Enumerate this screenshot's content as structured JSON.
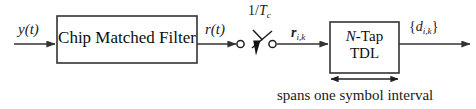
{
  "diagram": {
    "background_color": "#ffffff",
    "line_color": "#333333",
    "text_color": "#111111",
    "blocks": [
      {
        "id": "chip-matched-filter",
        "label": "Chip Matched Filter",
        "x": 57,
        "y": 16,
        "width": 140,
        "height": 47
      },
      {
        "id": "n-tap-tdl",
        "label_line1_italic": "N",
        "label_line1_rest": "-Tap",
        "label_line2": "TDL",
        "x": 330,
        "y": 22,
        "width": 69,
        "height": 51
      }
    ],
    "signals": {
      "input": {
        "base": "y",
        "arg": "(t)",
        "text": "y(t)"
      },
      "filter_output": {
        "base": "r",
        "arg": "(t)",
        "text": "r(t)"
      },
      "sampled": {
        "base": "r",
        "subscript": "i,k",
        "text": "r_i,k",
        "bold": true
      },
      "output": {
        "open": "{",
        "base": "d",
        "subscript": "i,k",
        "close": "}",
        "text": "{d_i,k}"
      }
    },
    "switch": {
      "rate_label_numerator": "1/",
      "rate_label_base": "T",
      "rate_label_subscript": "c",
      "rate_label_text": "1/Tc",
      "left_terminal_x": 240,
      "right_terminal_x": 272,
      "terminal_y": 44
    },
    "annotation": {
      "caption": "spans one symbol interval",
      "span_arrow_x1": 330,
      "span_arrow_x2": 399,
      "span_arrow_y": 79
    }
  }
}
